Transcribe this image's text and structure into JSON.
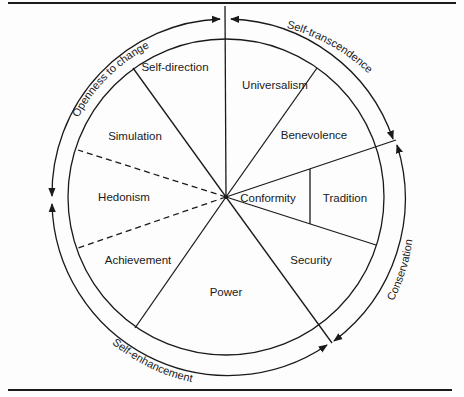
{
  "diagram": {
    "type": "circumplex",
    "center": [
      226,
      197
    ],
    "inner_radius": 158,
    "outer_radius": 177,
    "segments": [
      {
        "label": "Self-direction",
        "x": 175,
        "y": 71
      },
      {
        "label": "Universalism",
        "x": 275,
        "y": 89
      },
      {
        "label": "Benevolence",
        "x": 314,
        "y": 139
      },
      {
        "label": "Conformity",
        "x": 268,
        "y": 202
      },
      {
        "label": "Tradition",
        "x": 345,
        "y": 202
      },
      {
        "label": "Security",
        "x": 311,
        "y": 264
      },
      {
        "label": "Power",
        "x": 226,
        "y": 296
      },
      {
        "label": "Achievement",
        "x": 138,
        "y": 264
      },
      {
        "label": "Hedonism",
        "x": 124,
        "y": 201
      },
      {
        "label": "Simulation",
        "x": 135,
        "y": 140
      }
    ],
    "higher_order": [
      {
        "label": "Openness to change"
      },
      {
        "label": "Self-transcendence"
      },
      {
        "label": "Conservation"
      },
      {
        "label": "Self-enhancement"
      }
    ]
  },
  "colors": {
    "ink": "#1a1a1a",
    "background": "#fdfdfd"
  }
}
